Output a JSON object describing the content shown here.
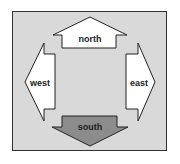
{
  "diagram": {
    "colors": {
      "background": "#d9d9d9",
      "border": "#333333",
      "arrow_fill": "#ffffff",
      "south_fill": "#8c8c8c",
      "stroke": "#222222"
    },
    "arrows": {
      "north": {
        "label": "north"
      },
      "west": {
        "label": "west"
      },
      "east": {
        "label": "east"
      },
      "south": {
        "label": "south"
      }
    }
  }
}
